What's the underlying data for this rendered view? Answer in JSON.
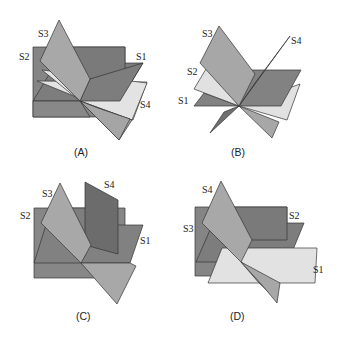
{
  "figure": {
    "colors": {
      "dark": "#7a7a7a",
      "mid_dark": "#8c8c8c",
      "medium": "#a9a9a9",
      "light": "#e2e2e2",
      "darkest": "#6a6a6a",
      "stroke": "#333333"
    },
    "panels": [
      {
        "id": "A",
        "caption": "(A)",
        "labels": {
          "S1": "S1",
          "S2": "S2",
          "S3": "S3",
          "S4": "S4"
        }
      },
      {
        "id": "B",
        "caption": "(B)",
        "labels": {
          "S1": "S1",
          "S2": "S2",
          "S3": "S3",
          "S4": "S4"
        }
      },
      {
        "id": "C",
        "caption": "(C)",
        "labels": {
          "S1": "S1",
          "S2": "S2",
          "S3": "S3",
          "S4": "S4"
        }
      },
      {
        "id": "D",
        "caption": "(D)",
        "labels": {
          "S1": "S1",
          "S2": "S2",
          "S3": "S3",
          "S4": "S4"
        }
      }
    ]
  }
}
